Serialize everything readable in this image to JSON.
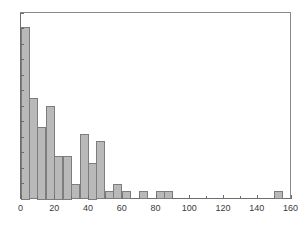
{
  "chart_data": {
    "type": "bar",
    "title": "",
    "subtitle": "",
    "xlabel": "",
    "ylabel": "",
    "legend": [],
    "grid": false,
    "xlim": [
      0,
      160
    ],
    "ylim": [
      0,
      26
    ],
    "bin_width": 5,
    "x_major_ticks": [
      0,
      20,
      40,
      60,
      80,
      100,
      120,
      140,
      160
    ],
    "x_minor_ticks": [
      10,
      30,
      50,
      70,
      90,
      110,
      130,
      150
    ],
    "x_tick_labels": [
      "0",
      "20",
      "40",
      "60",
      "80",
      "100",
      "120",
      "140",
      "160"
    ],
    "y_tick_count": 13,
    "y_tick_labels": [],
    "bin_edges": [
      0,
      5,
      10,
      15,
      20,
      25,
      30,
      35,
      40,
      45,
      50,
      55,
      60,
      65,
      70,
      75,
      80,
      85,
      90,
      150,
      155
    ],
    "categories": [
      "0-5",
      "5-10",
      "10-15",
      "15-20",
      "20-25",
      "25-30",
      "30-35",
      "35-40",
      "40-45",
      "45-50",
      "50-55",
      "55-60",
      "60-65",
      "70-75",
      "80-85",
      "85-90",
      "150-155"
    ],
    "values": [
      24,
      14,
      10,
      13,
      6,
      6,
      2,
      9,
      5,
      8,
      1,
      2,
      1,
      1,
      1,
      1,
      1
    ],
    "bars": [
      {
        "label": "0-5",
        "x0": 0,
        "x1": 5,
        "value": 24
      },
      {
        "label": "5-10",
        "x0": 5,
        "x1": 10,
        "value": 14
      },
      {
        "label": "10-15",
        "x0": 10,
        "x1": 15,
        "value": 10
      },
      {
        "label": "15-20",
        "x0": 15,
        "x1": 20,
        "value": 13
      },
      {
        "label": "20-25",
        "x0": 20,
        "x1": 25,
        "value": 6
      },
      {
        "label": "25-30",
        "x0": 25,
        "x1": 30,
        "value": 6
      },
      {
        "label": "30-35",
        "x0": 30,
        "x1": 35,
        "value": 2
      },
      {
        "label": "35-40",
        "x0": 35,
        "x1": 40,
        "value": 9
      },
      {
        "label": "40-45",
        "x0": 40,
        "x1": 45,
        "value": 5
      },
      {
        "label": "45-50",
        "x0": 45,
        "x1": 50,
        "value": 8
      },
      {
        "label": "50-55",
        "x0": 50,
        "x1": 55,
        "value": 1
      },
      {
        "label": "55-60",
        "x0": 55,
        "x1": 60,
        "value": 2
      },
      {
        "label": "60-65",
        "x0": 60,
        "x1": 65,
        "value": 1
      },
      {
        "label": "70-75",
        "x0": 70,
        "x1": 75,
        "value": 1
      },
      {
        "label": "80-85",
        "x0": 80,
        "x1": 85,
        "value": 1
      },
      {
        "label": "85-90",
        "x0": 85,
        "x1": 90,
        "value": 1
      },
      {
        "label": "150-155",
        "x0": 150,
        "x1": 155,
        "value": 1
      }
    ],
    "colors": {
      "bar_fill": "#b9b9b9",
      "bar_stroke": "#7d7d7d",
      "axis": "#6e6e6e",
      "frame": "#8a8a8a",
      "tick_label": "#3a3a3a",
      "background": "#ffffff"
    }
  }
}
